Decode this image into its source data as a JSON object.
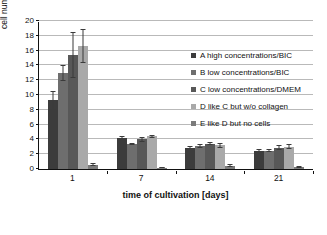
{
  "chart_data": {
    "type": "bar",
    "title": "",
    "xlabel": "time of cultivation [days]",
    "ylabel": "cell number per scaffold [10",
    "ylabel_sup": "4",
    "ylabel_suffix": "]",
    "categories": [
      "1",
      "7",
      "14",
      "21"
    ],
    "ylim": [
      0,
      20
    ],
    "yticks": [
      "0",
      "2",
      "4",
      "6",
      "8",
      "10",
      "12",
      "14",
      "16",
      "18",
      "20"
    ],
    "grid": true,
    "legend_position": "top-right-inside",
    "series": [
      {
        "name": "A high concentrations/BIC",
        "color": "#3c3c3c",
        "values": [
          9.3,
          4.2,
          2.9,
          2.5
        ],
        "errors": [
          1.3,
          0.3,
          0.2,
          0.2
        ]
      },
      {
        "name": "B low concentrations/BIC",
        "color": "#6e6e6e",
        "values": [
          13.0,
          3.4,
          3.1,
          2.5
        ],
        "errors": [
          1.1,
          0.15,
          0.25,
          0.15
        ]
      },
      {
        "name": "C low concentrations/DMEM",
        "color": "#585858",
        "values": [
          15.4,
          4.0,
          3.4,
          2.9
        ],
        "errors": [
          3.1,
          0.35,
          0.2,
          0.35
        ]
      },
      {
        "name": "D like C but w/o collagen",
        "color": "#a9a9a9",
        "values": [
          16.6,
          4.4,
          3.2,
          3.0
        ],
        "errors": [
          2.3,
          0.2,
          0.35,
          0.35
        ]
      },
      {
        "name": "E like D but no cells",
        "color": "#7b7b7b",
        "values": [
          0.6,
          0.2,
          0.45,
          0.25
        ],
        "errors": [
          0.15,
          0.08,
          0.2,
          0.1
        ]
      }
    ]
  }
}
